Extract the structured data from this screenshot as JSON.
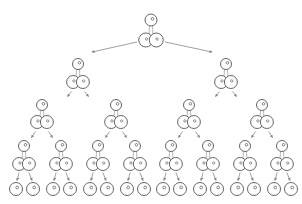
{
  "diagram": {
    "type": "binary-tree-of-cells",
    "stroke_color": "#555555",
    "arrow_color": "#888888",
    "levels": [
      {
        "level": 0,
        "head_y": 20,
        "pair_y": 40,
        "head_r": 6,
        "pair_r": 7,
        "xs": [
          151
        ]
      },
      {
        "level": 1,
        "head_y": 64,
        "pair_y": 82,
        "head_r": 5.5,
        "pair_r": 6.5,
        "xs": [
          78,
          226
        ]
      },
      {
        "level": 2,
        "head_y": 105,
        "pair_y": 122,
        "head_r": 5.5,
        "pair_r": 6.5,
        "xs": [
          42,
          116,
          189,
          262
        ]
      },
      {
        "level": 3,
        "head_y": 146,
        "pair_y": 164,
        "head_r": 5.5,
        "pair_r": 6.5,
        "xs": [
          24,
          61,
          98,
          135,
          171,
          208,
          245,
          282
        ]
      }
    ],
    "leaves": {
      "y": 189,
      "r": 6.5,
      "xs": [
        16,
        33,
        53,
        70,
        90,
        107,
        127,
        144,
        163,
        180,
        200,
        217,
        237,
        254,
        274,
        291
      ]
    }
  }
}
